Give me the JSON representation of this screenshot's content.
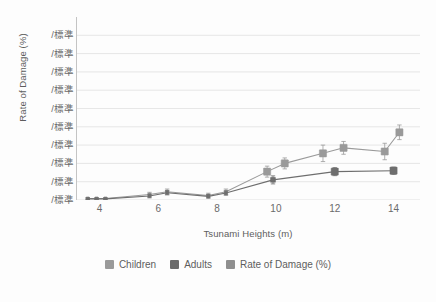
{
  "chart_data": {
    "type": "line",
    "title": "",
    "xlabel": "Tsunami Heights (m)",
    "ylabel": "Rate of Damage (%)",
    "xlim": [
      3.2,
      14.9
    ],
    "ylim": [
      0,
      10
    ],
    "grid": true,
    "legend_position": "bottom",
    "xticks": [
      4,
      6,
      8,
      10,
      12,
      14
    ],
    "ytick_labels": [
      "/標準",
      "/標準",
      "/標準",
      "/標準",
      "/標準",
      "/標準",
      "/標準",
      "/標準",
      "/標準",
      "/標準"
    ],
    "ytick_values": [
      9,
      8,
      7,
      6,
      5,
      4,
      3,
      2,
      1,
      0
    ],
    "series": [
      {
        "name": "Children",
        "color": "#9a9a9a",
        "marker": "square",
        "x": [
          3.6,
          3.9,
          4.2,
          5.7,
          6.3,
          7.7,
          8.3,
          9.7,
          10.3,
          11.6,
          12.3,
          13.7,
          14.2
        ],
        "values": [
          0.08,
          0.08,
          0.08,
          0.3,
          0.45,
          0.25,
          0.45,
          1.55,
          2.0,
          2.55,
          2.85,
          2.65,
          3.7
        ],
        "errors": [
          0.05,
          0.05,
          0.05,
          0.12,
          0.15,
          0.12,
          0.15,
          0.3,
          0.3,
          0.45,
          0.35,
          0.45,
          0.4
        ]
      },
      {
        "name": "Adults",
        "color": "#6e6e6e",
        "marker": "square",
        "x": [
          3.6,
          3.9,
          4.2,
          5.7,
          6.3,
          7.7,
          8.3,
          9.9,
          12.0,
          14.0
        ],
        "values": [
          0.06,
          0.06,
          0.06,
          0.22,
          0.4,
          0.2,
          0.38,
          1.1,
          1.55,
          1.6
        ],
        "errors": [
          0.04,
          0.04,
          0.04,
          0.1,
          0.12,
          0.1,
          0.12,
          0.22,
          0.22,
          0.2
        ]
      },
      {
        "name": "Rate of Damage (%)",
        "color": "#8a8a8a",
        "marker": "square",
        "x": [],
        "values": [],
        "errors": []
      }
    ]
  },
  "axes": {
    "ylabel": "Rate of Damage (%)",
    "xlabel": "Tsunami Heights (m)"
  },
  "legend": {
    "items": [
      {
        "label": "Children",
        "color": "#9a9a9a"
      },
      {
        "label": "Adults",
        "color": "#6b6b6b"
      },
      {
        "label": "Rate of Damage (%)",
        "color": "#8f8f8f"
      }
    ]
  }
}
